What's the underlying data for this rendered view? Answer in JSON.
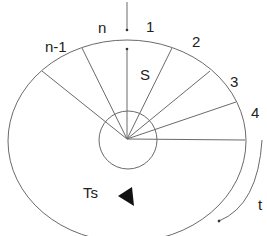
{
  "labels": {
    "slot_n": "n",
    "slot_1": "1",
    "slot_2": "2",
    "slot_3": "3",
    "slot_4": "4",
    "slot_n_minus_1": "n-1",
    "scan_vector": "S",
    "sample_period": "Ts",
    "time": "t"
  },
  "colors": {
    "line": "#6a6a6a",
    "text": "#222222",
    "arrow_fill": "#111111",
    "background": "#ffffff"
  }
}
